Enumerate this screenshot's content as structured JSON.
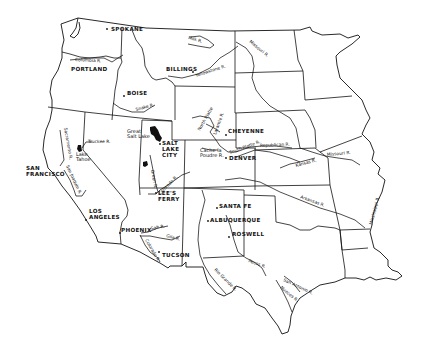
{
  "map": {
    "description": "Outline map of the western United States showing states, major rivers and cities",
    "cities": [
      {
        "name": "SPOKANE",
        "x": 110,
        "y": 30
      },
      {
        "name": "PORTLAND",
        "x": 70,
        "y": 70
      },
      {
        "name": "BILLINGS",
        "x": 166,
        "y": 70
      },
      {
        "name": "BOISE",
        "x": 127,
        "y": 94
      },
      {
        "name": "CHEYENNE",
        "x": 227,
        "y": 131
      },
      {
        "name": "DENVER",
        "x": 229,
        "y": 159
      },
      {
        "name": "SALT",
        "x": 162,
        "y": 145
      },
      {
        "name": "LAKE",
        "x": 162,
        "y": 151
      },
      {
        "name": "CITY",
        "x": 162,
        "y": 157
      },
      {
        "name": "SAN",
        "x": 26,
        "y": 170
      },
      {
        "name": "FRANCISCO",
        "x": 26,
        "y": 176
      },
      {
        "name": "LEE'S",
        "x": 158,
        "y": 195
      },
      {
        "name": "FERRY",
        "x": 158,
        "y": 201
      },
      {
        "name": "LOS",
        "x": 89,
        "y": 212
      },
      {
        "name": "ANGELES",
        "x": 89,
        "y": 218
      },
      {
        "name": "PHOENIX",
        "x": 121,
        "y": 231
      },
      {
        "name": "TUCSON",
        "x": 162,
        "y": 256
      },
      {
        "name": "SANTA FE",
        "x": 219,
        "y": 207
      },
      {
        "name": "ALBUQUERQUE",
        "x": 210,
        "y": 221
      },
      {
        "name": "ROSWELL",
        "x": 232,
        "y": 235
      }
    ],
    "rivers": [
      {
        "name": "Milk R.",
        "x": 190,
        "y": 40,
        "rotate": 15
      },
      {
        "name": "Missouri R.",
        "x": 250,
        "y": 43,
        "rotate": 40
      },
      {
        "name": "Yellowstone R.",
        "x": 196,
        "y": 72,
        "rotate": -18
      },
      {
        "name": "Columbia R.",
        "x": 75,
        "y": 61,
        "rotate": 3
      },
      {
        "name": "Snake R.",
        "x": 138,
        "y": 110,
        "rotate": -15
      },
      {
        "name": "Truckee R.",
        "x": 88,
        "y": 142,
        "rotate": 0
      },
      {
        "name": "Sacramento R.",
        "x": 63,
        "y": 152,
        "rotate": 80
      },
      {
        "name": "San Joaquin R.",
        "x": 68,
        "y": 182,
        "rotate": 65
      },
      {
        "name": "North Platte",
        "x": 200,
        "y": 124,
        "rotate": -60
      },
      {
        "name": "Laramie R.",
        "x": 216,
        "y": 129,
        "rotate": -70
      },
      {
        "name": "South Platte R.",
        "x": 230,
        "y": 152,
        "rotate": -20
      },
      {
        "name": "Republican R.",
        "x": 260,
        "y": 147,
        "rotate": -3
      },
      {
        "name": "Kansas R.",
        "x": 297,
        "y": 164,
        "rotate": -15
      },
      {
        "name": "Missouri R.",
        "x": 330,
        "y": 155,
        "rotate": -5
      },
      {
        "name": "Arkansas R.",
        "x": 302,
        "y": 198,
        "rotate": 20
      },
      {
        "name": "Mississippi R.",
        "x": 372,
        "y": 215,
        "rotate": -75
      },
      {
        "name": "Green R.",
        "x": 154,
        "y": 177,
        "rotate": 80
      },
      {
        "name": "Colorado R.",
        "x": 164,
        "y": 190,
        "rotate": -45
      },
      {
        "name": "Salt R.",
        "x": 153,
        "y": 230,
        "rotate": -10
      },
      {
        "name": "Gila R.",
        "x": 167,
        "y": 237,
        "rotate": 15
      },
      {
        "name": "Colorado R.",
        "x": 143,
        "y": 244,
        "rotate": 60
      },
      {
        "name": "Rio Grande R.",
        "x": 214,
        "y": 272,
        "rotate": 45
      },
      {
        "name": "Pecos R.",
        "x": 250,
        "y": 263,
        "rotate": 20
      },
      {
        "name": "San Antonio R.",
        "x": 284,
        "y": 282,
        "rotate": 25
      },
      {
        "name": "Nueces R.",
        "x": 281,
        "y": 290,
        "rotate": 40
      }
    ],
    "features": [
      {
        "name": "Great",
        "x": 127,
        "y": 133
      },
      {
        "name": "Salt Lake",
        "x": 127,
        "y": 138
      },
      {
        "name": "Lake",
        "x": 76,
        "y": 155
      },
      {
        "name": "Tahoe",
        "x": 76,
        "y": 160
      },
      {
        "name": "Cache la",
        "x": 200,
        "y": 151
      },
      {
        "name": "Poudre R.",
        "x": 200,
        "y": 156
      }
    ]
  }
}
